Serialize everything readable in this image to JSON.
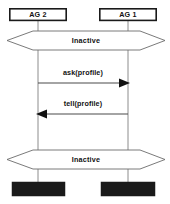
{
  "diagram": {
    "type": "uml-sequence-diagram",
    "background_color": "#ffffff",
    "width": 170,
    "height": 204,
    "lifelines": [
      {
        "id": "ag2",
        "label": "AG 2",
        "x": 38,
        "box": {
          "x": 9,
          "y": 8,
          "width": 58,
          "height": 13
        },
        "terminator": {
          "x": 12,
          "y": 182,
          "width": 53,
          "height": 14,
          "color": "#1a1a1a"
        }
      },
      {
        "id": "ag1",
        "label": "AG 1",
        "x": 128,
        "box": {
          "x": 99,
          "y": 8,
          "width": 58,
          "height": 13
        },
        "terminator": {
          "x": 101,
          "y": 182,
          "width": 54,
          "height": 14,
          "color": "#1a1a1a"
        }
      }
    ],
    "states": [
      {
        "id": "state-top",
        "label": "Inactive",
        "y": 31,
        "height": 19,
        "left_tip_x": 7,
        "right_tip_x": 165,
        "body_left_x": 33,
        "body_right_x": 140
      },
      {
        "id": "state-bottom",
        "label": "Inactive",
        "y": 150,
        "height": 19,
        "left_tip_x": 7,
        "right_tip_x": 165,
        "body_left_x": 33,
        "body_right_x": 140
      }
    ],
    "messages": [
      {
        "id": "msg-ask",
        "label": "ask(profile)",
        "from": "ag2",
        "to": "ag1",
        "direction": "right",
        "y": 83,
        "label_y": 73,
        "start_x": 38,
        "end_x": 129
      },
      {
        "id": "msg-tell",
        "label": "tell(profile)",
        "from": "ag1",
        "to": "ag2",
        "direction": "left",
        "y": 114,
        "label_y": 104,
        "start_x": 128,
        "end_x": 37
      }
    ],
    "colors": {
      "stroke": "#1a1a1a",
      "lifeline": "#8c8c8c",
      "state_stroke": "#6b6b6b",
      "terminator": "#1a1a1a",
      "text": "#111111"
    }
  }
}
